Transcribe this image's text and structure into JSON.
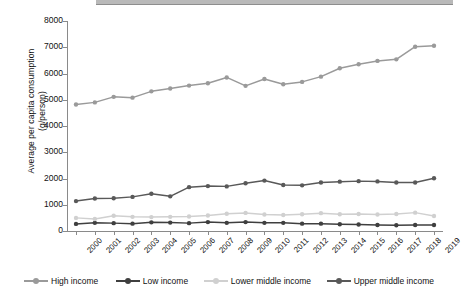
{
  "chart_data": {
    "type": "line",
    "title": "",
    "xlabel": "",
    "ylabel": "Average per capita consumption (g/person)",
    "ylabel_line1": "Average per capita consumption",
    "ylabel_line2": "(g/person)",
    "ylim": [
      0,
      8000
    ],
    "ytick_values": [
      8000,
      7000,
      6000,
      5000,
      4000,
      3000,
      2000,
      1000,
      0
    ],
    "ytick_labels": [
      "8000",
      "7000",
      "6000",
      "5000",
      "4000",
      "3000",
      "2000",
      "1000",
      "0"
    ],
    "grid": false,
    "legend_position": "bottom",
    "categories": [
      "2000",
      "2001",
      "2002",
      "2003",
      "2004",
      "2005",
      "2006",
      "2007",
      "2008",
      "2009",
      "2010",
      "2011",
      "2012",
      "2013",
      "2014",
      "2015",
      "2016",
      "2017",
      "2018",
      "2019"
    ],
    "x": [
      2000,
      2001,
      2002,
      2003,
      2004,
      2005,
      2006,
      2007,
      2008,
      2009,
      2010,
      2011,
      2012,
      2013,
      2014,
      2015,
      2016,
      2017,
      2018,
      2019
    ],
    "series": [
      {
        "name": "High income",
        "color": "#9a9a9a",
        "values": [
          4820,
          4900,
          5110,
          5080,
          5320,
          5430,
          5540,
          5630,
          5850,
          5530,
          5790,
          5590,
          5680,
          5880,
          6200,
          6350,
          6480,
          6540,
          7020,
          7060
        ]
      },
      {
        "name": "Low income",
        "color": "#3f3f3f",
        "values": [
          270,
          310,
          300,
          280,
          330,
          320,
          300,
          340,
          310,
          340,
          310,
          310,
          280,
          280,
          260,
          250,
          230,
          220,
          230,
          230
        ]
      },
      {
        "name": "Lower middle income",
        "color": "#d0d0d0",
        "values": [
          500,
          460,
          580,
          540,
          530,
          540,
          550,
          590,
          660,
          690,
          630,
          610,
          640,
          680,
          640,
          650,
          630,
          650,
          700,
          570
        ]
      },
      {
        "name": "Upper middle income",
        "color": "#595959",
        "values": [
          1140,
          1240,
          1250,
          1300,
          1420,
          1320,
          1670,
          1710,
          1700,
          1820,
          1920,
          1750,
          1740,
          1850,
          1880,
          1900,
          1890,
          1850,
          1850,
          2010
        ]
      }
    ]
  },
  "legend": {
    "items": [
      {
        "label": "High income",
        "color": "#9a9a9a"
      },
      {
        "label": "Low income",
        "color": "#3f3f3f"
      },
      {
        "label": "Lower middle income",
        "color": "#d0d0d0"
      },
      {
        "label": "Upper middle income",
        "color": "#595959"
      }
    ]
  }
}
